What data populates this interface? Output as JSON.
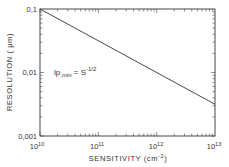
{
  "chart_data": {
    "type": "line",
    "title": "",
    "xlabel": "SENSITIVITY (cm",
    "xlabel_sup": "-2",
    "xlabel_close": ")",
    "ylabel": "RESOLUTION ( μm)",
    "xscale": "log",
    "yscale": "log",
    "xlim": [
      10000000000.0,
      10000000000000.0
    ],
    "ylim": [
      0.001,
      0.1
    ],
    "grid": false,
    "x_ticks": [
      {
        "base": "10",
        "exp": "10",
        "value": 10000000000.0
      },
      {
        "base": "10",
        "exp": "11",
        "value": 100000000000.0
      },
      {
        "base": "10",
        "exp": "12",
        "value": 1000000000000.0
      },
      {
        "base": "10",
        "exp": "13",
        "value": 10000000000000.0
      }
    ],
    "y_ticks": [
      {
        "label": "0,1",
        "value": 0.1
      },
      {
        "label": "0,01",
        "value": 0.01
      },
      {
        "label": "0,001",
        "value": 0.001
      }
    ],
    "series": [
      {
        "name": "lp,min = S^-1/2",
        "x": [
          10000000000.0,
          100000000000.0,
          1000000000000.0,
          10000000000000.0
        ],
        "y": [
          0.1,
          0.0316,
          0.01,
          0.00316
        ]
      }
    ],
    "annotation": {
      "main": "lp",
      "sub": ",min",
      "eq": " = S",
      "sup": "-1/2"
    },
    "colors": {
      "line": "#333333",
      "background": "#ffffff"
    }
  }
}
